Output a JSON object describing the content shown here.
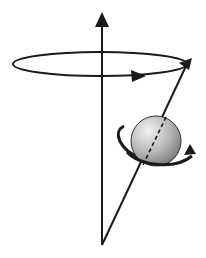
{
  "diagram": {
    "colors": {
      "stroke": "#1a1a1a",
      "sphere_light": "#e8e8e8",
      "sphere_dark": "#8a8a8a",
      "background": "#ffffff"
    },
    "elements": [
      {
        "name": "vertical-axis-arrow",
        "label": ""
      },
      {
        "name": "precession-orbit-ellipse",
        "label": ""
      },
      {
        "name": "orbit-direction-arrow",
        "label": ""
      },
      {
        "name": "spin-axis-vector",
        "label": ""
      },
      {
        "name": "spinning-sphere",
        "label": ""
      },
      {
        "name": "spin-rotation-arrow",
        "label": ""
      }
    ]
  }
}
